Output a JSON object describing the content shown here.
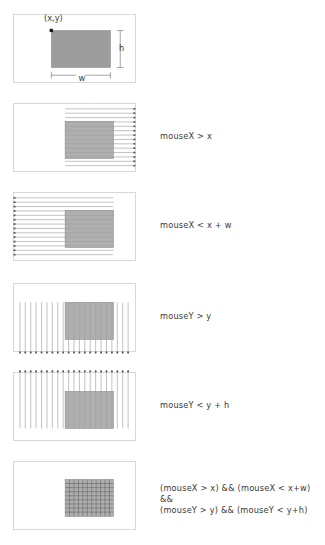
{
  "figure": {
    "background": "#ffffff",
    "rect_fill": "#9d9d9d",
    "rect_stroke": "#8a8a8a",
    "panel_border": "#d8d8d8",
    "line_color": "#8c8c8c",
    "text_color": "#3a3a3a"
  },
  "panels": [
    {
      "id": "panel-definitions",
      "caption": "",
      "labels": {
        "origin": "(x,y)",
        "width": "w",
        "height": "h"
      }
    },
    {
      "id": "panel-mousex-gt-x",
      "caption": "mouseX > x",
      "labels": {}
    },
    {
      "id": "panel-mousex-lt-xw",
      "caption": "mouseX < x + w",
      "labels": {}
    },
    {
      "id": "panel-mousey-gt-y",
      "caption": "mouseY > y",
      "labels": {}
    },
    {
      "id": "panel-mousey-lt-yh",
      "caption": "mouseY < y + h",
      "labels": {}
    },
    {
      "id": "panel-combined",
      "caption": "(mouseX > x) && (mouseX < x+w) &&\n(mouseY > y) && (mouseY < y+h)",
      "labels": {}
    }
  ]
}
